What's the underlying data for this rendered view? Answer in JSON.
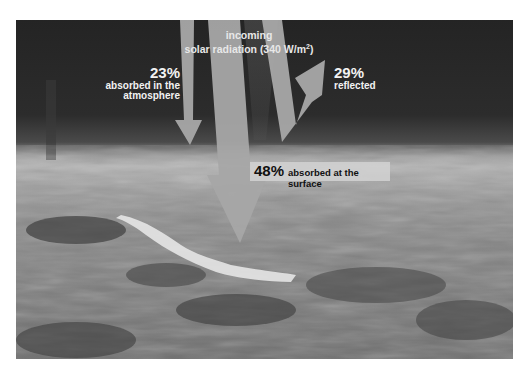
{
  "diagram": {
    "title_line1": "incoming",
    "title_line2": "solar radiation (340 W/m",
    "title_superscript": "2",
    "title_close": ")",
    "atmosphere": {
      "percent": "23%",
      "line1": "absorbed in the",
      "line2": "atmosphere"
    },
    "reflected": {
      "percent": "29%",
      "label": "reflected"
    },
    "surface": {
      "percent": "48%",
      "label": "absorbed at the surface"
    }
  },
  "colors": {
    "space": "#262626",
    "arrow": "#a8a8a8",
    "label_text": "#f2f2f2",
    "surface_label_bg": "#d2d2d2"
  }
}
